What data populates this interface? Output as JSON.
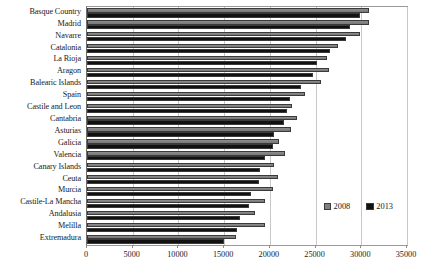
{
  "chart_data": {
    "type": "bar",
    "orientation": "horizontal",
    "title": "",
    "xlabel": "",
    "ylabel": "",
    "xlim": [
      0,
      35000
    ],
    "xticks": [
      0,
      5000,
      10000,
      15000,
      20000,
      25000,
      30000,
      35000
    ],
    "xtick_labels": [
      "0",
      "5000",
      "10000",
      "15000",
      "20000",
      "25000",
      "30000",
      "35000"
    ],
    "grid": true,
    "legend_position": "inside lower-right",
    "categories": [
      "Basque Country",
      "Madrid",
      "Navarre",
      "Catalonia",
      "La Rioja",
      "Aragon",
      "Balearic Islands",
      "Spain",
      "Castile and Leon",
      "Cantabria",
      "Asturias",
      "Galicia",
      "Valencia",
      "Canary Islands",
      "Ceuta",
      "Murcia",
      "Castile-La Mancha",
      "Andalusia",
      "Melilla",
      "Extremadura"
    ],
    "series": [
      {
        "name": "2008",
        "color": "#808080",
        "values": [
          30800,
          30800,
          29900,
          27500,
          26300,
          26500,
          25600,
          23800,
          22400,
          23000,
          22300,
          21000,
          21700,
          20400,
          20900,
          20300,
          19500,
          18400,
          19500,
          16300
        ]
      },
      {
        "name": "2013",
        "color": "#111111",
        "values": [
          29900,
          28800,
          28300,
          26600,
          25200,
          24700,
          23400,
          22200,
          21900,
          21500,
          20500,
          20300,
          19500,
          18900,
          18800,
          17900,
          17700,
          16700,
          16400,
          15000
        ]
      }
    ]
  },
  "legend": {
    "items": [
      {
        "label": "2008",
        "swatch": "gray-square-swatch"
      },
      {
        "label": "2013",
        "swatch": "black-square-swatch"
      }
    ]
  }
}
